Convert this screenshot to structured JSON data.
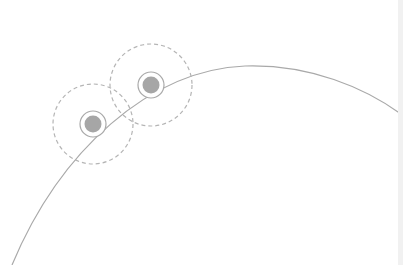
{
  "colors": {
    "background": "#ffffff",
    "arc": "#a9a9a9",
    "dot_fill": "#a6a6a6",
    "ring": "#a9a9a9",
    "dashed": "#b5b5b5",
    "edge_strip": "#f1f1f1"
  },
  "arc": {
    "path": "M 12 265 C 60 150, 150 70, 245 66 C 310 64, 365 88, 401 114"
  },
  "nodes": [
    {
      "id": "node-1",
      "cx": 93,
      "cy": 124,
      "dot_r": 8.5,
      "ring_r": 13,
      "halo_r": 40
    },
    {
      "id": "node-2",
      "cx": 151,
      "cy": 85,
      "dot_r": 8.5,
      "ring_r": 13,
      "halo_r": 41
    }
  ]
}
